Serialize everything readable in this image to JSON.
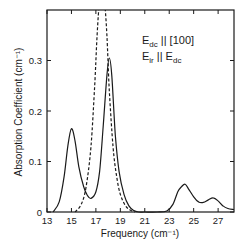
{
  "chart_data": {
    "type": "line",
    "title": "",
    "xlabel": "Frequency (cm⁻¹)",
    "ylabel": "Absorption Coefficient (cm⁻¹)",
    "xlim": [
      13,
      28.3
    ],
    "ylim": [
      0,
      0.4
    ],
    "grid": false,
    "legend": null,
    "x_ticks": [
      13,
      15,
      17,
      19,
      21,
      23,
      25,
      27
    ],
    "x_tick_labels": [
      "13",
      "15",
      "17",
      "19",
      "21",
      "23",
      "25",
      "27"
    ],
    "y_ticks": [
      0,
      0.1,
      0.2,
      0.3
    ],
    "y_tick_labels": [
      "0",
      "0.1",
      "0.2",
      "0.3"
    ],
    "annotations": [
      {
        "text_main": "E",
        "sub": "dc",
        "rest": " || [100]"
      },
      {
        "text_main": "E",
        "sub": "ir",
        "rest": " || E",
        "sub2": "dc"
      }
    ],
    "series": [
      {
        "name": "solid",
        "style": "solid",
        "x": [
          13.5,
          14.0,
          14.4,
          14.7,
          15.0,
          15.3,
          15.6,
          16.0,
          16.3,
          16.6,
          17.0,
          17.3,
          17.6,
          17.9,
          18.1,
          18.3,
          18.6,
          18.9,
          19.3,
          19.7,
          20.1,
          20.5,
          21.0,
          22.0,
          22.8,
          23.3,
          23.7,
          24.0,
          24.3,
          24.6,
          25.0,
          25.4,
          25.8,
          26.2,
          26.6,
          27.0,
          27.4,
          27.8,
          28.3
        ],
        "y": [
          0.0,
          0.02,
          0.07,
          0.13,
          0.165,
          0.14,
          0.09,
          0.05,
          0.033,
          0.027,
          0.04,
          0.08,
          0.17,
          0.27,
          0.305,
          0.27,
          0.15,
          0.08,
          0.035,
          0.012,
          0.003,
          0.0,
          0.0,
          0.0,
          0.002,
          0.015,
          0.04,
          0.05,
          0.055,
          0.045,
          0.03,
          0.02,
          0.019,
          0.024,
          0.028,
          0.022,
          0.012,
          0.007,
          0.005
        ]
      },
      {
        "name": "dashed",
        "style": "dashed",
        "x": [
          15.3,
          15.8,
          16.2,
          16.6,
          16.9,
          17.1,
          17.3,
          17.5,
          17.7,
          17.9,
          18.1,
          18.4,
          18.7,
          19.0,
          19.4,
          19.8,
          20.2
        ],
        "y": [
          0.0,
          0.015,
          0.05,
          0.13,
          0.25,
          0.35,
          0.42,
          0.45,
          0.42,
          0.35,
          0.24,
          0.13,
          0.07,
          0.035,
          0.013,
          0.004,
          0.0
        ]
      }
    ]
  }
}
